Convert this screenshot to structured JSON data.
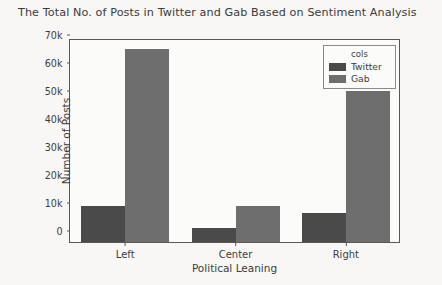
{
  "chart_data": {
    "type": "bar",
    "title": "The Total No. of Posts in Twitter and Gab Based on Sentiment Analysis",
    "xlabel": "Political Leaning",
    "ylabel": "Number of Posts",
    "categories": [
      "Left",
      "Center",
      "Right"
    ],
    "series": [
      {
        "name": "Twitter",
        "color": "#4a4a4a",
        "values": [
          13000,
          5000,
          10500
        ]
      },
      {
        "name": "Gab",
        "color": "#6e6e6e",
        "values": [
          69000,
          13000,
          54000
        ]
      }
    ],
    "legend": {
      "title": "cols",
      "position": "upper-right"
    },
    "ylim": [
      0,
      73000
    ],
    "yticks": [
      {
        "value": 0,
        "label": "0"
      },
      {
        "value": 10000,
        "label": "10k"
      },
      {
        "value": 20000,
        "label": "20k"
      },
      {
        "value": 30000,
        "label": "30k"
      },
      {
        "value": 40000,
        "label": "40k"
      },
      {
        "value": 50000,
        "label": "50k"
      },
      {
        "value": 60000,
        "label": "60k"
      },
      {
        "value": 70000,
        "label": "70k"
      }
    ],
    "grid": false
  }
}
